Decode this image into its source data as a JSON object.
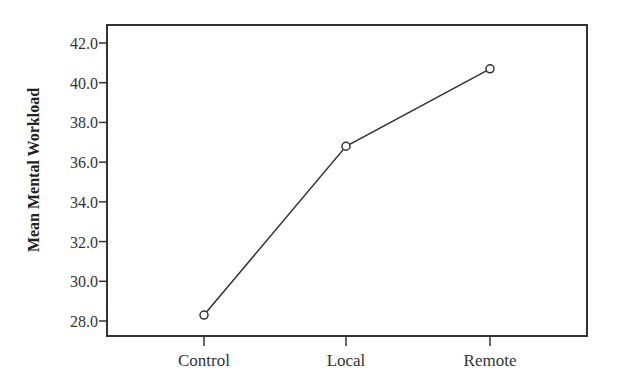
{
  "chart_data": {
    "type": "line",
    "title": "",
    "xlabel": "",
    "ylabel": "Mean Mental Workload",
    "categories": [
      "Control",
      "Local",
      "Remote"
    ],
    "series": [
      {
        "name": "Mean Mental Workload",
        "values": [
          28.3,
          36.8,
          40.7
        ],
        "marker": "open-circle"
      }
    ],
    "ylim": [
      27.2,
      42.9
    ],
    "yticks": [
      "42.0",
      "40.0",
      "38.0",
      "36.0",
      "34.0",
      "32.0",
      "30.0",
      "28.0"
    ],
    "grid": false,
    "legend": "none",
    "colors": {
      "line": "#333333",
      "frame": "#333333",
      "background": "#ffffff"
    }
  }
}
